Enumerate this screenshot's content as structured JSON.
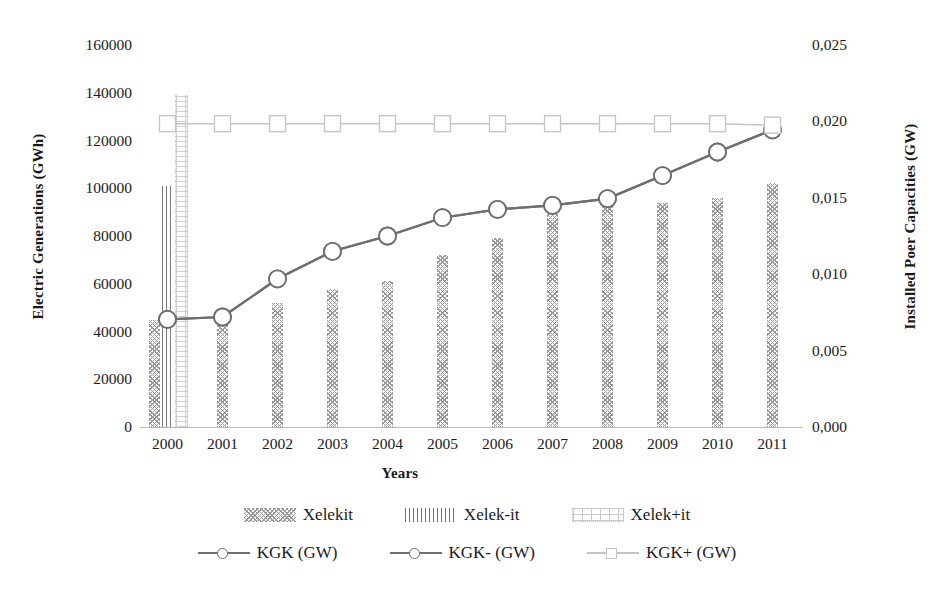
{
  "chart_data": {
    "type": "bar",
    "title": "",
    "xlabel": "Years",
    "ylabel": "Electric Generations (GWh)",
    "y2label": "Installed Poer Capacities (GW)",
    "categories": [
      "2000",
      "2001",
      "2002",
      "2003",
      "2004",
      "2005",
      "2006",
      "2007",
      "2008",
      "2009",
      "2010",
      "2011"
    ],
    "ylim": [
      0,
      160000
    ],
    "y2lim": [
      0,
      0.025
    ],
    "yticks": [
      "0",
      "20000",
      "40000",
      "60000",
      "80000",
      "100000",
      "120000",
      "140000",
      "160000"
    ],
    "ytick_values": [
      0,
      20000,
      40000,
      60000,
      80000,
      100000,
      120000,
      140000,
      160000
    ],
    "y2ticks": [
      "0,000",
      "0,005",
      "0,010",
      "0,015",
      "0,020",
      "0,025"
    ],
    "y2tick_values": [
      0,
      0.005,
      0.01,
      0.015,
      0.02,
      0.025
    ],
    "grid": false,
    "legend_position": "bottom",
    "series": [
      {
        "name": "Xelekit",
        "kind": "bar",
        "pattern": "cross-hatch",
        "axis": "left",
        "color": "#9a9a9a",
        "values": [
          45000,
          46000,
          52000,
          58000,
          61000,
          72000,
          79000,
          92000,
          95000,
          94000,
          96000,
          102000
        ]
      },
      {
        "name": "Xelek-it",
        "kind": "bar",
        "pattern": "vertical-lines",
        "axis": "left",
        "color": "#7a7a7a",
        "values": [
          101000,
          null,
          null,
          null,
          null,
          null,
          null,
          null,
          null,
          null,
          null,
          null
        ]
      },
      {
        "name": "Xelek+it",
        "kind": "bar",
        "pattern": "dotted-outline",
        "axis": "left",
        "color": "#cfcfcf",
        "values": [
          139000,
          null,
          null,
          null,
          null,
          null,
          null,
          null,
          null,
          null,
          null,
          null
        ]
      },
      {
        "name": "KGK (GW)",
        "kind": "line",
        "marker": "circle",
        "axis": "right",
        "color": "#6e6e6e",
        "values": [
          0.00705,
          0.0072,
          0.0097,
          0.0115,
          0.0125,
          0.0137,
          0.01425,
          0.0145,
          0.01495,
          0.01645,
          0.018,
          0.01945
        ]
      },
      {
        "name": "KGK- (GW)",
        "kind": "line",
        "marker": "circle",
        "axis": "right",
        "color": "#6e6e6e",
        "values": [
          0.00705,
          0.0072,
          0.0097,
          0.0115,
          0.0125,
          0.0137,
          0.01425,
          0.0145,
          0.01495,
          0.01645,
          0.018,
          0.01945
        ]
      },
      {
        "name": "KGK+ (GW)",
        "kind": "line",
        "marker": "square",
        "axis": "right",
        "color": "#c4c4c4",
        "values": [
          0.01985,
          0.01985,
          0.01985,
          0.01985,
          0.01985,
          0.01985,
          0.01985,
          0.01985,
          0.01985,
          0.01985,
          0.01985,
          0.01975
        ]
      }
    ]
  },
  "axes": {
    "left_title": "Electric Generations (GWh)",
    "right_title": "Installed Poer Capacities (GW)",
    "x_title": "Years"
  },
  "legend": {
    "row1": [
      {
        "label": "Xelekit",
        "swatch": "hatch"
      },
      {
        "label": "Xelek-it",
        "swatch": "vline"
      },
      {
        "label": "Xelek+it",
        "swatch": "dotted"
      }
    ],
    "row2": [
      {
        "label": "KGK (GW)",
        "swatch": "line-circle",
        "color": "#6e6e6e"
      },
      {
        "label": "KGK- (GW)",
        "swatch": "line-circle",
        "color": "#6e6e6e"
      },
      {
        "label": "KGK+ (GW)",
        "swatch": "line-square",
        "color": "#c4c4c4"
      }
    ]
  }
}
